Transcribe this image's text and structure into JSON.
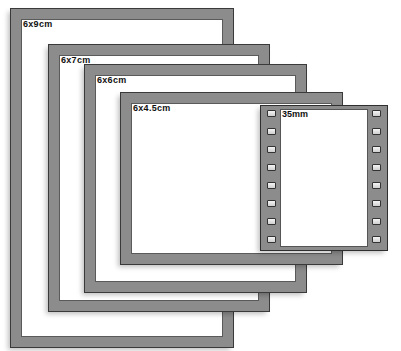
{
  "diagram": {
    "frame_color": "#8c8c8c",
    "outline_color": "#3a3a3a",
    "background": "#ffffff",
    "frames": [
      {
        "id": "6x9",
        "label": "6x9cm",
        "box": {
          "left": 11,
          "top": 9,
          "width": 222,
          "height": 338
        }
      },
      {
        "id": "6x7",
        "label": "6x7cm",
        "box": {
          "left": 49,
          "top": 45,
          "width": 220,
          "height": 266
        }
      },
      {
        "id": "6x6",
        "label": "6x6cm",
        "box": {
          "left": 85,
          "top": 65,
          "width": 221,
          "height": 227
        }
      },
      {
        "id": "6x45",
        "label": "6x4.5cm",
        "box": {
          "left": 121,
          "top": 93,
          "width": 221,
          "height": 171
        }
      }
    ],
    "film_35mm": {
      "label": "35mm",
      "box": {
        "left": 261,
        "top": 106,
        "width": 126,
        "height": 144
      },
      "sprockets_per_side": 8
    }
  }
}
